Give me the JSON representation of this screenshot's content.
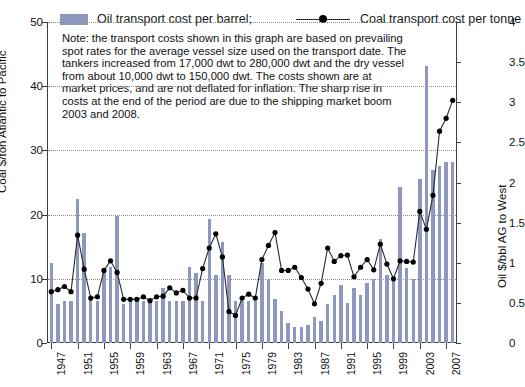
{
  "legend": {
    "bar_label": "Oil transport cost per barrel;",
    "line_label": "Coal transport cost per tonne",
    "bar_color": "#8e97bd",
    "line_color": "#2b2b2b",
    "marker_color": "#000000"
  },
  "note": "Note: the transport costs shown in this graph are based on prevailing spot rates for the average vessel size used on the transport date. The tankers increased from 17,000 dwt to 280,000 dwt and the dry vessel from about 10,000 dwt to 150,000 dwt. The costs shown are at market prices, and are not deflated for inflation. The sharp rise in costs at the end of the period are due to the shipping market boom 2003 and 2008.",
  "axes": {
    "left_title": "Coal $/ton Atlantic to Pacific",
    "right_title": "Oil $/bbl AG to West",
    "left_ticks": [
      "0",
      "10",
      "20",
      "30",
      "40",
      "50"
    ],
    "right_ticks": [
      "0",
      "0.5",
      "1",
      "1.5",
      "2",
      "2.5",
      "3",
      "3.5",
      "4"
    ],
    "x_ticks": [
      "1947",
      "1951",
      "1955",
      "1959",
      "1963",
      "1967",
      "1971",
      "1975",
      "1979",
      "1983",
      "1987",
      "1991",
      "1995",
      "1999",
      "2003",
      "2007"
    ]
  },
  "chart_data": {
    "type": "bar",
    "title": "",
    "xlabel": "",
    "ylabel": "Coal $/ton Atlantic to Pacific",
    "ylabel_right": "Oil $/bbl AG to West",
    "ylim": [
      0,
      50
    ],
    "ylim_right": [
      0,
      4
    ],
    "grid": true,
    "legend_position": "top",
    "x": [
      1947,
      1948,
      1949,
      1950,
      1951,
      1952,
      1953,
      1954,
      1955,
      1956,
      1957,
      1958,
      1959,
      1960,
      1961,
      1962,
      1963,
      1964,
      1965,
      1966,
      1967,
      1968,
      1969,
      1970,
      1971,
      1972,
      1973,
      1974,
      1975,
      1976,
      1977,
      1978,
      1979,
      1980,
      1981,
      1982,
      1983,
      1984,
      1985,
      1986,
      1987,
      1988,
      1989,
      1990,
      1991,
      1992,
      1993,
      1994,
      1995,
      1996,
      1997,
      1998,
      1999,
      2000,
      2001,
      2002,
      2003,
      2004,
      2005,
      2006,
      2007,
      2008
    ],
    "series": [
      {
        "name": "Oil transport cost per barrel",
        "type": "bar",
        "axis": "right",
        "units": "$/bbl AG to West",
        "values": [
          1.0,
          0.48,
          0.52,
          0.52,
          1.8,
          1.37,
          0.55,
          0.52,
          0.93,
          0.95,
          1.58,
          0.48,
          0.52,
          0.52,
          0.52,
          0.52,
          0.52,
          0.68,
          0.52,
          0.52,
          0.52,
          0.95,
          0.87,
          0.52,
          1.55,
          0.85,
          1.26,
          0.85,
          0.52,
          0.52,
          0.52,
          0.52,
          1.0,
          0.8,
          0.55,
          0.4,
          0.25,
          0.2,
          0.2,
          0.22,
          0.33,
          0.28,
          0.48,
          0.6,
          0.72,
          0.5,
          0.68,
          0.6,
          0.75,
          0.8,
          1.3,
          0.85,
          0.82,
          1.95,
          0.93,
          0.8,
          2.05,
          3.45,
          2.15,
          2.2,
          2.25,
          2.25
        ]
      },
      {
        "name": "Coal transport cost per tonne",
        "type": "line",
        "axis": "left",
        "units": "$/ton Atlantic to Pacific",
        "values": [
          8.0,
          8.3,
          8.8,
          8.0,
          16.8,
          11.5,
          7.0,
          7.2,
          11.3,
          12.8,
          11.0,
          6.8,
          6.8,
          6.8,
          7.2,
          6.6,
          7.2,
          7.3,
          8.6,
          7.8,
          8.2,
          7.0,
          7.0,
          11.6,
          14.8,
          17.0,
          13.4,
          4.9,
          4.3,
          7.0,
          7.6,
          7.0,
          13.0,
          15.2,
          17.2,
          11.3,
          11.3,
          11.8,
          10.2,
          8.4,
          6.1,
          9.3,
          14.8,
          12.7,
          13.6,
          13.7,
          10.3,
          11.8,
          13.0,
          11.4,
          15.4,
          12.3,
          10.0,
          12.8,
          12.7,
          12.6,
          20.5,
          17.7,
          23.0,
          33.0,
          35.0,
          37.8
        ]
      }
    ]
  }
}
